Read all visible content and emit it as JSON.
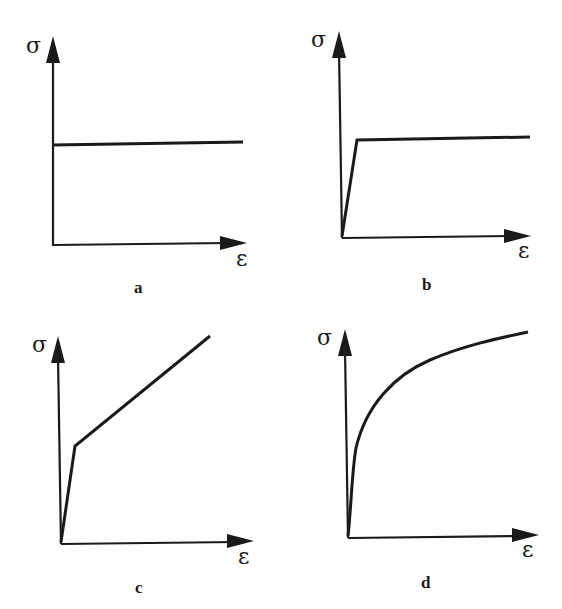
{
  "figure": {
    "panels": [
      {
        "id": "a",
        "caption": "a",
        "y_label": "σ",
        "x_label": "ε",
        "model": "rigid-perfectly plastic"
      },
      {
        "id": "b",
        "caption": "b",
        "y_label": "σ",
        "x_label": "ε",
        "model": "elastic-perfectly plastic"
      },
      {
        "id": "c",
        "caption": "c",
        "y_label": "σ",
        "x_label": "ε",
        "model": "elastic-linear hardening"
      },
      {
        "id": "d",
        "caption": "d",
        "y_label": "σ",
        "x_label": "ε",
        "model": "nonlinear hardening"
      }
    ]
  },
  "colors": {
    "ink": "#1a1a1a",
    "background": "#ffffff"
  }
}
